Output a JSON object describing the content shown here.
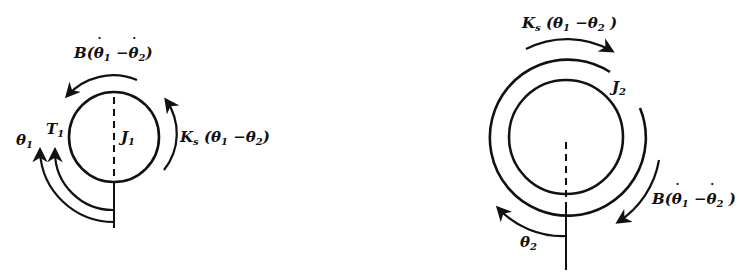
{
  "diagram": {
    "type": "two-inertia free-body diagram (torsional spring + damper)",
    "left_body": {
      "inertia_label": "J",
      "inertia_sub": "1",
      "applied_torque_label": "T",
      "applied_torque_sub": "1",
      "angle_label": "θ",
      "angle_sub": "1",
      "damper_torque": {
        "prefix": "B(",
        "a": "θ",
        "a_sub": "1",
        "minus": " −",
        "b": "θ",
        "b_sub": "2",
        "suffix": ")"
      },
      "spring_torque": {
        "prefix": "K",
        "k_sub": "s",
        "open": " (",
        "a": "θ",
        "a_sub": "1",
        "minus": " −",
        "b": "θ",
        "b_sub": "2",
        "suffix": ")"
      }
    },
    "right_body": {
      "inertia_label": "J",
      "inertia_sub": "2",
      "angle_label": "θ",
      "angle_sub": "2",
      "spring_torque": {
        "prefix": "K",
        "k_sub": "s",
        "open": " (",
        "a": "θ",
        "a_sub": "1",
        "minus": " −",
        "b": "θ",
        "b_sub": "2",
        "suffix": " )"
      },
      "damper_torque": {
        "prefix": "B(",
        "a": "θ",
        "a_sub": "1",
        "minus": " −",
        "b": "θ",
        "b_sub": "2",
        "suffix": " )"
      }
    },
    "colors": {
      "stroke": "#111111",
      "background": "#ffffff"
    }
  }
}
